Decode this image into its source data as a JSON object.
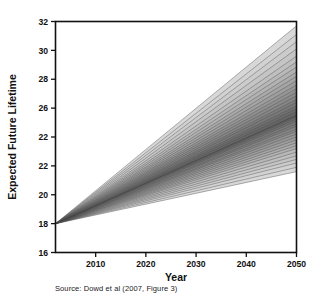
{
  "figure": {
    "caption": "Source: Dowd et al (2007, Figure 3)"
  },
  "chart_data": {
    "type": "area",
    "title": "",
    "xlabel": "Year",
    "ylabel": "Expected Future Lifetime",
    "xlim": [
      2002,
      2050
    ],
    "ylim": [
      16,
      32
    ],
    "xticks": [
      2010,
      2020,
      2030,
      2040,
      2050
    ],
    "xtick_labels": [
      "2010",
      "2020",
      "2030",
      "2040",
      "2050"
    ],
    "yticks": [
      16,
      18,
      20,
      22,
      24,
      26,
      28,
      30,
      32
    ],
    "ytick_labels": [
      "16",
      "18",
      "20",
      "22",
      "22",
      "26",
      "28",
      "30",
      "32"
    ],
    "grid": false,
    "legend": null,
    "origin": {
      "x": 2002,
      "y": 18.0
    },
    "x": [
      2002,
      2050
    ],
    "median": {
      "name": "median",
      "values": [
        18.0,
        25.5
      ]
    },
    "bands": [
      {
        "name": "p01-p99",
        "lower": [
          18.0,
          21.6
        ],
        "upper": [
          18.0,
          31.7
        ],
        "shade": "#d8d8d8"
      },
      {
        "name": "p03-p97",
        "lower": [
          18.0,
          21.9
        ],
        "upper": [
          18.0,
          31.1
        ],
        "shade": "#d2d2d2"
      },
      {
        "name": "p06-p94",
        "lower": [
          18.0,
          22.2
        ],
        "upper": [
          18.0,
          30.6
        ],
        "shade": "#cccccc"
      },
      {
        "name": "p09-p91",
        "lower": [
          18.0,
          22.45
        ],
        "upper": [
          18.0,
          30.1
        ],
        "shade": "#c5c5c5"
      },
      {
        "name": "p12-p88",
        "lower": [
          18.0,
          22.7
        ],
        "upper": [
          18.0,
          29.6
        ],
        "shade": "#bfbfbf"
      },
      {
        "name": "p15-p85",
        "lower": [
          18.0,
          22.95
        ],
        "upper": [
          18.0,
          29.2
        ],
        "shade": "#b8b8b8"
      },
      {
        "name": "p18-p82",
        "lower": [
          18.0,
          23.2
        ],
        "upper": [
          18.0,
          28.85
        ],
        "shade": "#b2b2b2"
      },
      {
        "name": "p21-p79",
        "lower": [
          18.0,
          23.4
        ],
        "upper": [
          18.0,
          28.5
        ],
        "shade": "#ababab"
      },
      {
        "name": "p24-p76",
        "lower": [
          18.0,
          23.6
        ],
        "upper": [
          18.0,
          28.2
        ],
        "shade": "#a5a5a5"
      },
      {
        "name": "p27-p73",
        "lower": [
          18.0,
          23.8
        ],
        "upper": [
          18.0,
          27.9
        ],
        "shade": "#9e9e9e"
      },
      {
        "name": "p30-p70",
        "lower": [
          18.0,
          24.0
        ],
        "upper": [
          18.0,
          27.6
        ],
        "shade": "#989898"
      },
      {
        "name": "p33-p67",
        "lower": [
          18.0,
          24.2
        ],
        "upper": [
          18.0,
          27.35
        ],
        "shade": "#919191"
      },
      {
        "name": "p36-p64",
        "lower": [
          18.0,
          24.4
        ],
        "upper": [
          18.0,
          27.1
        ],
        "shade": "#8b8b8b"
      },
      {
        "name": "p39-p61",
        "lower": [
          18.0,
          24.55
        ],
        "upper": [
          18.0,
          26.85
        ],
        "shade": "#858585"
      },
      {
        "name": "p42-p58",
        "lower": [
          18.0,
          24.75
        ],
        "upper": [
          18.0,
          26.6
        ],
        "shade": "#7e7e7e"
      },
      {
        "name": "p45-p55",
        "lower": [
          18.0,
          24.9
        ],
        "upper": [
          18.0,
          26.4
        ],
        "shade": "#787878"
      },
      {
        "name": "p47-p53",
        "lower": [
          18.0,
          25.1
        ],
        "upper": [
          18.0,
          26.15
        ],
        "shade": "#717171"
      },
      {
        "name": "p48-p52",
        "lower": [
          18.0,
          25.25
        ],
        "upper": [
          18.0,
          25.95
        ],
        "shade": "#6b6b6b"
      },
      {
        "name": "p49-p51",
        "lower": [
          18.0,
          25.38
        ],
        "upper": [
          18.0,
          25.75
        ],
        "shade": "#656565"
      }
    ]
  }
}
